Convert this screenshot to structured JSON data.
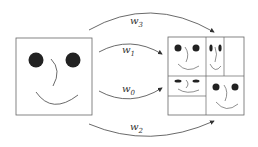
{
  "diagram": {
    "type": "fractal-image-transform",
    "source_label": "original face image",
    "target_label": "collage of transformed copies",
    "maps": [
      {
        "name": "w3",
        "base": "w",
        "sub": "3"
      },
      {
        "name": "w1",
        "base": "w",
        "sub": "1"
      },
      {
        "name": "w0",
        "base": "w",
        "sub": "0"
      },
      {
        "name": "w2",
        "base": "w",
        "sub": "2"
      }
    ],
    "colors": {
      "stroke": "#555555",
      "fill": "#222222"
    }
  }
}
